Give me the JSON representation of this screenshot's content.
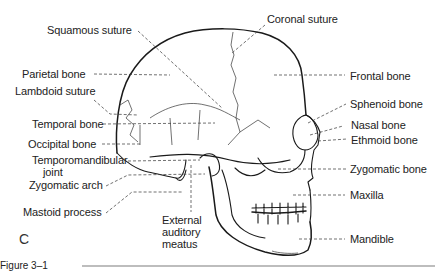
{
  "figure": {
    "panel_letter": "C",
    "caption_fragment": "Figure 3–1"
  },
  "labels": {
    "squamous_suture": "Squamous suture",
    "coronal_suture": "Coronal suture",
    "parietal_bone": "Parietal bone",
    "frontal_bone": "Frontal bone",
    "lambdoid_suture": "Lambdoid suture",
    "sphenoid_bone": "Sphenoid bone",
    "temporal_bone": "Temporal bone",
    "nasal_bone": "Nasal bone",
    "ethmoid_bone": "Ethmoid bone",
    "occipital_bone": "Occipital bone",
    "tmj_line1": "Temporomandibular",
    "tmj_line2": "joint",
    "zygomatic_bone": "Zygomatic bone",
    "zygomatic_arch": "Zygomatic arch",
    "maxilla": "Maxilla",
    "mastoid_process": "Mastoid process",
    "eam_line1": "External",
    "eam_line2": "auditory",
    "eam_line3": "meatus",
    "mandible": "Mandible"
  },
  "colors": {
    "line": "#1a1a1a",
    "text": "#222222",
    "caption_rule": "#bdbdbd"
  }
}
